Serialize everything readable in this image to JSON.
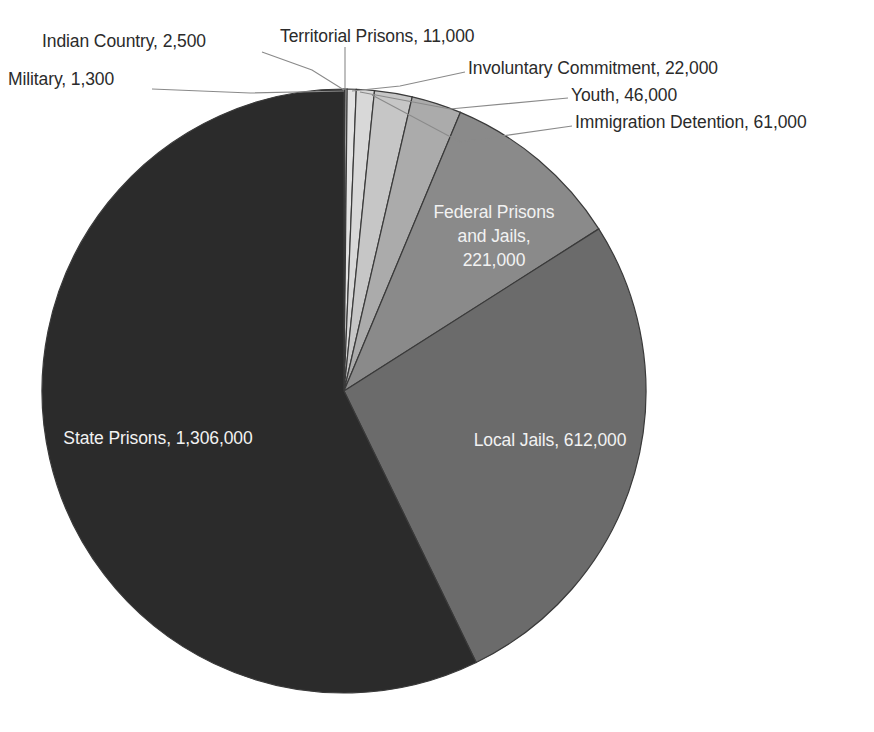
{
  "chart_data": {
    "type": "pie",
    "title": "",
    "subtitle": "",
    "xlabel": "",
    "ylabel": "",
    "legend_position": "none",
    "grid": false,
    "total": 2282800,
    "units": "people",
    "categories": [
      "Military",
      "Indian Country",
      "Territorial Prisons",
      "Involuntary Commitment",
      "Youth",
      "Immigration Detention",
      "Federal Prisons and Jails",
      "Local Jails",
      "State Prisons"
    ],
    "values": [
      1300,
      2500,
      11000,
      22000,
      46000,
      61000,
      221000,
      612000,
      1306000
    ],
    "value_labels": [
      "1,300",
      "2,500",
      "11,000",
      "22,000",
      "46,000",
      "61,000",
      "221,000",
      "612,000",
      "1,306,000"
    ],
    "slice_colors": [
      "#f7f7f7",
      "#ededed",
      "#e2e2e2",
      "#d8d8d8",
      "#c6c6c6",
      "#ababab",
      "#8a8a8a",
      "#6b6b6b",
      "#2b2b2b"
    ],
    "slices": [
      {
        "name": "Military",
        "value": 1300,
        "display": "Military, 1,300",
        "color": "#f7f7f7",
        "label_placement": "callout"
      },
      {
        "name": "Indian Country",
        "value": 2500,
        "display": "Indian Country, 2,500",
        "color": "#ededed",
        "label_placement": "callout"
      },
      {
        "name": "Territorial Prisons",
        "value": 11000,
        "display": "Territorial Prisons, 11,000",
        "color": "#e2e2e2",
        "label_placement": "callout"
      },
      {
        "name": "Involuntary Commitment",
        "value": 22000,
        "display": "Involuntary Commitment, 22,000",
        "color": "#d8d8d8",
        "label_placement": "callout"
      },
      {
        "name": "Youth",
        "value": 46000,
        "display": "Youth, 46,000",
        "color": "#c6c6c6",
        "label_placement": "callout"
      },
      {
        "name": "Immigration Detention",
        "value": 61000,
        "display": "Immigration Detention, 61,000",
        "color": "#ababab",
        "label_placement": "callout"
      },
      {
        "name": "Federal Prisons and Jails",
        "value": 221000,
        "display": "Federal Prisons and Jails, 221,000",
        "color": "#8a8a8a",
        "label_placement": "inside"
      },
      {
        "name": "Local Jails",
        "value": 612000,
        "display": "Local Jails, 612,000",
        "color": "#6b6b6b",
        "label_placement": "inside"
      },
      {
        "name": "State Prisons",
        "value": 1306000,
        "display": "State Prisons, 1,306,000",
        "color": "#2b2b2b",
        "label_placement": "inside"
      }
    ]
  },
  "callouts": {
    "indian_country": "Indian Country, 2,500",
    "military": "Military, 1,300",
    "territorial_prisons": "Territorial Prisons, 11,000",
    "involuntary_commitment": "Involuntary Commitment, 22,000",
    "youth": "Youth, 46,000",
    "immigration_detention": "Immigration Detention, 61,000"
  },
  "inside_labels": {
    "federal_line1": "Federal Prisons",
    "federal_line2": "and Jails,",
    "federal_line3": "221,000",
    "local_jails": "Local Jails, 612,000",
    "state_prisons": "State Prisons, 1,306,000"
  }
}
